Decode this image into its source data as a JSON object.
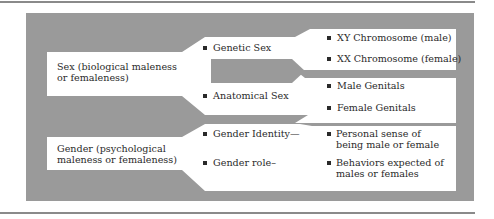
{
  "colors": {
    "panel_gray": "#9a9a9a",
    "box_white": "#ffffff",
    "rule_gray": "#8a8a8a",
    "text": "#2a2a2a"
  },
  "sex": {
    "label_line1": "Sex (biological maleness",
    "label_line2": "or femaleness)",
    "components": [
      {
        "label": "Genetic Sex",
        "details": [
          "XY Chromosome (male)",
          "XX Chromosome (female)"
        ]
      },
      {
        "label": "Anatomical Sex",
        "details": [
          "Male Genitals",
          "Female Genitals"
        ]
      }
    ]
  },
  "gender": {
    "label_line1": "Gender (psychological",
    "label_line2": "maleness or femaleness)",
    "components": [
      {
        "label": "Gender Identity—",
        "detail_line1": "Personal sense of",
        "detail_line2": "being male or female"
      },
      {
        "label": "Gender role–",
        "detail_line1": "Behaviors expected of",
        "detail_line2": "males or females"
      }
    ]
  }
}
